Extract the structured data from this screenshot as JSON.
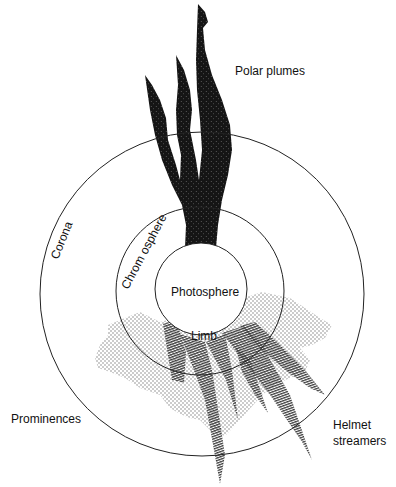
{
  "diagram": {
    "labels": {
      "polar_plumes": "Polar plumes",
      "corona": "Corona",
      "chromosphere": "Chrom osphere",
      "photosphere": "Photosphere",
      "limb": "Limb",
      "prominences": "Prominences",
      "helmet_line1": "Helmet",
      "helmet_line2": "streamers"
    },
    "colors": {
      "background": "#ffffff",
      "line": "#222222",
      "plume_fill": "#1a1a1a",
      "streamer_hatch": "#444444",
      "prominence_dots": "#888888"
    }
  }
}
